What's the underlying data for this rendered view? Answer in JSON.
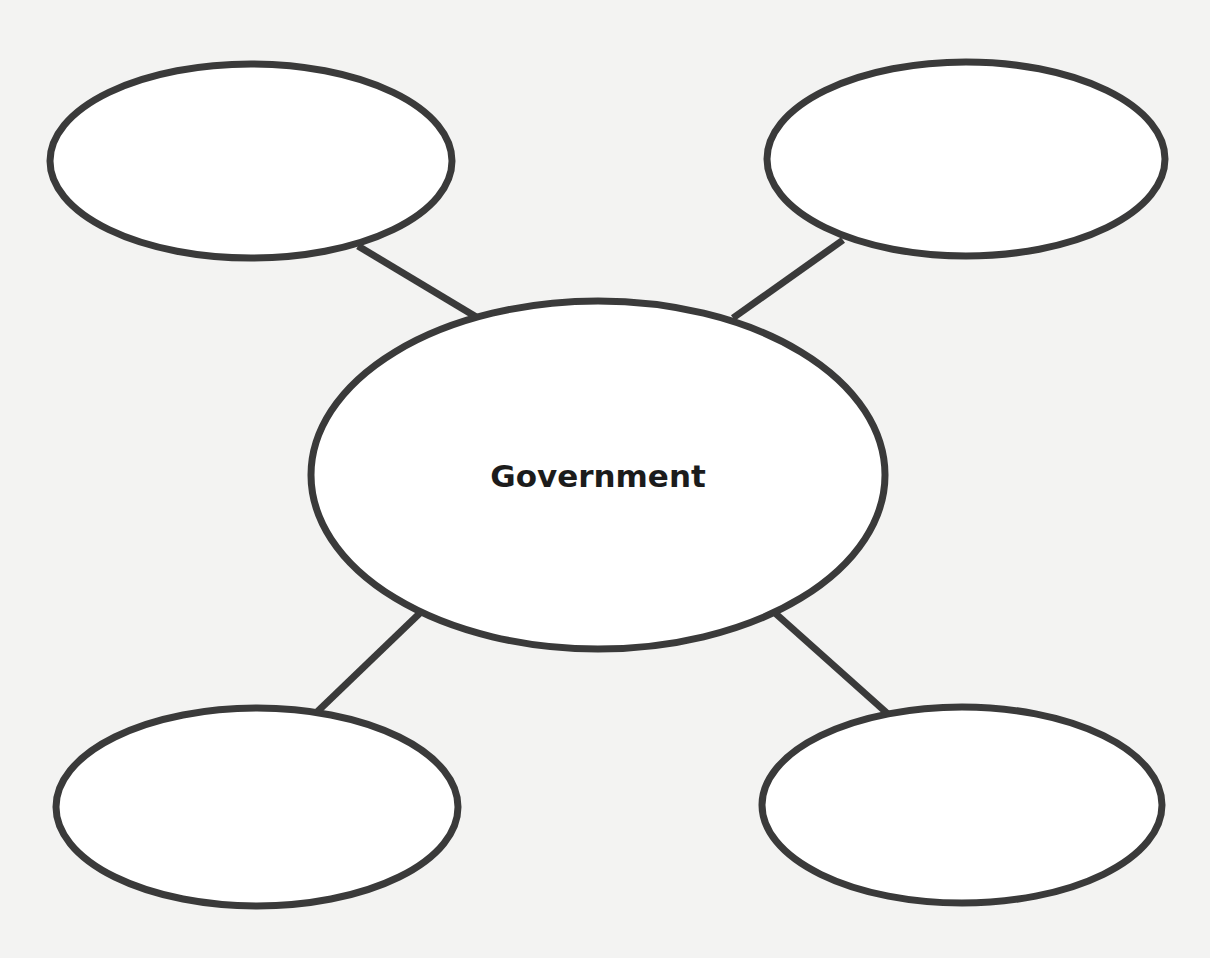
{
  "diagram": {
    "type": "concept-web",
    "center": {
      "label": "Government"
    },
    "satellites": [
      {
        "position": "top-left",
        "label": ""
      },
      {
        "position": "top-right",
        "label": ""
      },
      {
        "position": "bottom-left",
        "label": ""
      },
      {
        "position": "bottom-right",
        "label": ""
      }
    ],
    "colors": {
      "background": "#f3f3f2",
      "stroke": "#3a3a3a",
      "fill": "#ffffff",
      "text": "#1c1c1c"
    }
  }
}
